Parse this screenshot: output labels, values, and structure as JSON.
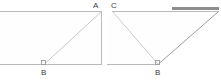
{
  "canvas": {
    "width": 221,
    "height": 81,
    "background": "#ffffff"
  },
  "style": {
    "outline_color": "#b9b9b9",
    "outline_width": 1,
    "diagonal_color": "#c9c9c9",
    "diagonal_width": 1,
    "highlight_color": "#8d8d8d",
    "highlight_width": 3,
    "marker_color": "#9a9a9a",
    "label_color": "#3d3d3d",
    "label_font_size": "8px"
  },
  "figures": [
    {
      "name": "left-figure",
      "kind": "rectangle-with-diagonal",
      "outline": "M -14 11 L 101.5 11 L 101.5 64 L -14 64 Z",
      "diagonal": "M 44.5 64 L 101.5 11.5",
      "right_angle_marker": {
        "x": 41.5,
        "y": 60.5,
        "size": 3.5
      },
      "vertices": [
        {
          "label": "A",
          "x": 94,
          "y": 2,
          "position": "above-right-corner"
        },
        {
          "label": "B",
          "x": 41,
          "y": 69,
          "position": "below-bottom-edge"
        }
      ]
    },
    {
      "name": "right-figure",
      "kind": "inverted-triangle-with-edges",
      "top_edge": "M 112 11 L 218.5 11",
      "bottom_edge": "M 107 64 L 158.5 64",
      "diagonal_left": "M 112.5 11.5 L 158 64",
      "diagonal_right": "M 218 12 L 158.5 64",
      "highlight_edge": "M 172 8.5 L 219 8.5",
      "right_angle_marker": {
        "x": 155.5,
        "y": 60.5,
        "size": 3.5
      },
      "vertices": [
        {
          "label": "C",
          "x": 111,
          "y": 2,
          "position": "above-left-corner"
        },
        {
          "label": "B",
          "x": 155,
          "y": 69,
          "position": "below-bottom-edge"
        }
      ]
    }
  ],
  "labels": {
    "left_top": "A",
    "left_bottom": "B",
    "right_top": "C",
    "right_bottom": "B"
  }
}
